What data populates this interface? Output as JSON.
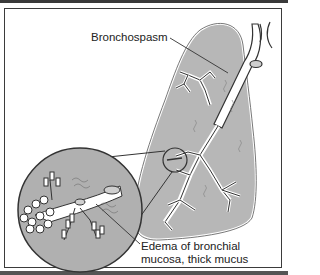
{
  "figure": {
    "type": "medical-illustration",
    "labels": {
      "bronchospasm": "Bronchospasm",
      "edema_line1": "Edema of bronchial",
      "edema_line2": "mucosa, thick mucus"
    },
    "colors": {
      "lung_fill": "#b7b7b7",
      "inset_fill": "#b0b0b0",
      "airway_fill": "#ffffff",
      "outline": "#3b3b3b",
      "frame_border": "#3b3b3b",
      "background": "#ffffff"
    }
  }
}
